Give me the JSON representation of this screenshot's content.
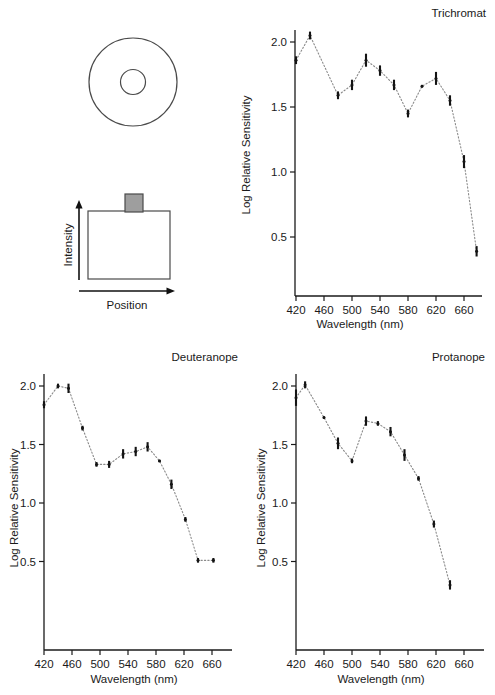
{
  "figure": {
    "stimulus_diagram": {
      "name": "stimulus-diagram",
      "outer_circle_label": "adapting-field-circle",
      "inner_circle_label": "test-spot-circle",
      "inner_fill": "#9e9e9e",
      "profile_label": "intensity-profile",
      "y_axis_label": "Intensity",
      "x_axis_label": "Position",
      "pedestal_fill": "#9e9e9e"
    }
  },
  "chart_data": [
    {
      "type": "line",
      "name": "trichromat",
      "title": "Trichromat",
      "xlabel": "Wavelength (nm)",
      "ylabel": "Log Relative Sensitivity",
      "xticks": [
        420,
        460,
        500,
        540,
        580,
        620,
        660
      ],
      "xlim": [
        410,
        675
      ],
      "yticks": [
        0.5,
        1.0,
        1.5,
        2.0
      ],
      "ytick_labels": [
        "0.5",
        "1.0",
        "1.5",
        "2.0"
      ],
      "ylim": [
        0.12,
        2.22
      ],
      "grid": false,
      "legend": "none",
      "x": [
        420,
        440,
        480,
        500,
        520,
        540,
        560,
        580,
        600,
        620,
        640,
        660,
        678
      ],
      "values": [
        1.86,
        2.05,
        1.59,
        1.67,
        1.86,
        1.78,
        1.67,
        1.45,
        1.66,
        1.72,
        1.55,
        1.08,
        0.39
      ],
      "err_low": [
        0.03,
        0.03,
        0.03,
        0.04,
        0.05,
        0.04,
        0.04,
        0.03,
        0.01,
        0.05,
        0.04,
        0.05,
        0.04
      ],
      "err_high": [
        0.03,
        0.03,
        0.03,
        0.04,
        0.05,
        0.04,
        0.04,
        0.03,
        0.01,
        0.05,
        0.04,
        0.05,
        0.04
      ]
    },
    {
      "type": "line",
      "name": "deuteranope",
      "title": "Deuteranope",
      "xlabel": "Wavelength (nm)",
      "ylabel": "Log Relative Sensitivity",
      "xticks": [
        420,
        460,
        500,
        540,
        580,
        620,
        660
      ],
      "xlim": [
        410,
        672
      ],
      "yticks": [
        0.5,
        1.0,
        1.5,
        2.0
      ],
      "ytick_labels": [
        "0.5",
        "1.0",
        "1.5",
        "2.0"
      ],
      "ylim": [
        0.12,
        2.22
      ],
      "grid": false,
      "legend": "none",
      "x": [
        420,
        440,
        455,
        475,
        495,
        513,
        533,
        551,
        568,
        585,
        602,
        622,
        640,
        662
      ],
      "values": [
        1.84,
        2.0,
        1.98,
        1.64,
        1.33,
        1.33,
        1.42,
        1.44,
        1.48,
        1.36,
        1.16,
        0.86,
        0.51,
        0.51
      ],
      "err_low": [
        0.03,
        0.02,
        0.04,
        0.02,
        0.02,
        0.03,
        0.04,
        0.04,
        0.04,
        0.01,
        0.04,
        0.02,
        0.02,
        0.02
      ],
      "err_high": [
        0.03,
        0.02,
        0.04,
        0.02,
        0.02,
        0.03,
        0.04,
        0.04,
        0.04,
        0.01,
        0.04,
        0.02,
        0.02,
        0.02
      ]
    },
    {
      "type": "line",
      "name": "protanope",
      "title": "Protanope",
      "xlabel": "Wavelength (nm)",
      "ylabel": "Log Relative Sensitivity",
      "xticks": [
        420,
        460,
        500,
        540,
        580,
        620,
        660
      ],
      "xlim": [
        410,
        672
      ],
      "yticks": [
        0.5,
        1.0,
        1.5,
        2.0
      ],
      "ytick_labels": [
        "0.5",
        "1.0",
        "1.5",
        "2.0"
      ],
      "ylim": [
        0.12,
        2.22
      ],
      "grid": false,
      "legend": "none",
      "x": [
        420,
        433,
        460,
        480,
        500,
        520,
        537,
        555,
        575,
        595,
        617,
        640
      ],
      "values": [
        1.9,
        2.01,
        1.73,
        1.51,
        1.36,
        1.7,
        1.68,
        1.61,
        1.41,
        1.21,
        0.82,
        0.3
      ],
      "err_low": [
        0.07,
        0.03,
        0.01,
        0.05,
        0.02,
        0.04,
        0.02,
        0.04,
        0.05,
        0.02,
        0.03,
        0.04
      ],
      "err_high": [
        0.07,
        0.03,
        0.01,
        0.05,
        0.02,
        0.04,
        0.02,
        0.04,
        0.05,
        0.02,
        0.03,
        0.04
      ]
    }
  ]
}
